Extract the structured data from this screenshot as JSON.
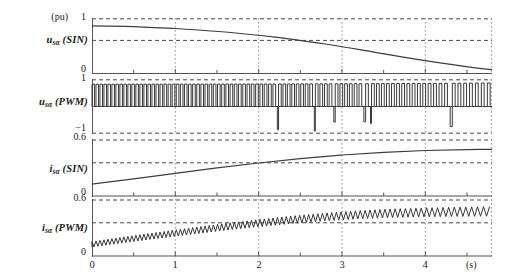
{
  "figure": {
    "x_unit": "(s)",
    "pu_unit": "(pu)",
    "x_ticks": [
      "0",
      "1",
      "2",
      "3",
      "4"
    ],
    "x_tick_values": [
      0,
      1,
      2,
      3,
      4
    ],
    "x_range": [
      0,
      4.8
    ]
  },
  "panels": [
    {
      "id": "u-sin",
      "label_name": "u",
      "label_sub": "sα",
      "label_paren": "(SIN)",
      "label_text": "u_sα (SIN)",
      "y_ticks": [
        "1",
        "0"
      ],
      "y_tick_values": [
        1,
        0
      ],
      "y_range": [
        0,
        1
      ],
      "dashed_levels": [
        1,
        0.6
      ]
    },
    {
      "id": "u-pwm",
      "label_name": "u",
      "label_sub": "sα",
      "label_paren": "(PWM)",
      "label_text": "u_sα (PWM)",
      "y_ticks": [
        "1",
        "−1"
      ],
      "y_tick_values": [
        1,
        -1
      ],
      "y_range": [
        -1,
        1
      ],
      "dashed_levels": [
        1,
        -1
      ]
    },
    {
      "id": "i-sin",
      "label_name": "i",
      "label_sub": "sα",
      "label_paren": "(SIN)",
      "label_text": "i_sα (SIN)",
      "y_ticks": [
        "0.6",
        "0"
      ],
      "y_tick_values": [
        0.6,
        0
      ],
      "y_range": [
        0,
        0.6
      ],
      "dashed_levels": [
        0.6,
        0.36
      ]
    },
    {
      "id": "i-pwm",
      "label_name": "i",
      "label_sub": "sα",
      "label_paren": "(PWM)",
      "label_text": "i_sα (PWM)",
      "y_ticks": [
        "0.6",
        "0"
      ],
      "y_tick_values": [
        0.6,
        0
      ],
      "y_range": [
        0,
        0.6
      ],
      "dashed_levels": [
        0.6,
        0.36
      ]
    }
  ],
  "chart_data": {
    "type": "line",
    "title": "",
    "xlabel": "(s)",
    "ylabel": "(pu)",
    "xlim": [
      0,
      4.8
    ],
    "grid": true,
    "legend": "none",
    "subplots": [
      {
        "name": "u_sα (SIN)",
        "ylim": [
          0,
          1
        ],
        "yticks": [
          0,
          1
        ],
        "gridlines_y": [
          0.6,
          1.0
        ],
        "description": "smooth reference voltage slowly decreasing",
        "x": [
          0,
          0.4,
          0.8,
          1.2,
          1.6,
          2.0,
          2.4,
          2.8,
          3.2,
          3.6,
          4.0,
          4.4,
          4.8
        ],
        "y": [
          0.86,
          0.855,
          0.845,
          0.83,
          0.81,
          0.785,
          0.755,
          0.715,
          0.67,
          0.615,
          0.55,
          0.475,
          0.39
        ]
      },
      {
        "name": "u_sα (PWM)",
        "ylim": [
          -1,
          1
        ],
        "yticks": [
          -1,
          1
        ],
        "gridlines_y": [
          -1.0,
          1.0
        ],
        "description": "switched two-level PWM voltage, pulse width grows and switching frequency drops with time; negative spikes appear near the end"
      },
      {
        "name": "i_sα (SIN)",
        "ylim": [
          0,
          0.6
        ],
        "yticks": [
          0,
          0.6
        ],
        "gridlines_y": [
          0.36,
          0.6
        ],
        "description": "smooth stator current rising and saturating",
        "x": [
          0,
          0.4,
          0.8,
          1.2,
          1.6,
          2.0,
          2.4,
          2.8,
          3.2,
          3.6,
          4.0,
          4.4,
          4.8
        ],
        "y": [
          0.125,
          0.175,
          0.222,
          0.268,
          0.312,
          0.352,
          0.388,
          0.418,
          0.442,
          0.458,
          0.468,
          0.474,
          0.478
        ]
      },
      {
        "name": "i_sα (PWM)",
        "ylim": [
          0,
          0.6
        ],
        "yticks": [
          0,
          0.6
        ],
        "gridlines_y": [
          0.36,
          0.6
        ],
        "description": "stator current with triangular switching ripple superimposed on the rising mean; ripple amplitude ~0.05 pu growing slightly",
        "mean_x": [
          0,
          0.4,
          0.8,
          1.2,
          1.6,
          2.0,
          2.4,
          2.8,
          3.2,
          3.6,
          4.0,
          4.4,
          4.8
        ],
        "mean_y": [
          0.125,
          0.175,
          0.222,
          0.268,
          0.312,
          0.352,
          0.388,
          0.418,
          0.442,
          0.458,
          0.468,
          0.474,
          0.478
        ]
      }
    ]
  }
}
